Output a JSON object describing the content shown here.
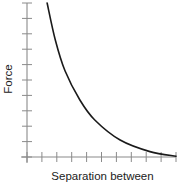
{
  "chart_data": {
    "type": "line",
    "title": "",
    "xlabel": "Separation between",
    "ylabel": "Force",
    "x_ticks": 11,
    "y_ticks": 11,
    "tick_labels_shown": false,
    "grid": false,
    "legend": null,
    "xlim": [
      0,
      10
    ],
    "ylim": [
      0,
      10
    ],
    "series": [
      {
        "name": "Force vs separation",
        "x": [
          1.35,
          1.9,
          2.55,
          3.55,
          4.55,
          6.25,
          8.25,
          10.0
        ],
        "y": [
          10.0,
          7.6,
          5.6,
          3.7,
          2.4,
          1.1,
          0.35,
          0.05
        ],
        "color": "#1a1a1a",
        "shape": "decreasing-convex"
      }
    ]
  },
  "axes": {
    "color": "#8a8a8a",
    "origin_px": [
      27,
      157
    ],
    "x_end_px": 176,
    "y_end_px": 3
  }
}
